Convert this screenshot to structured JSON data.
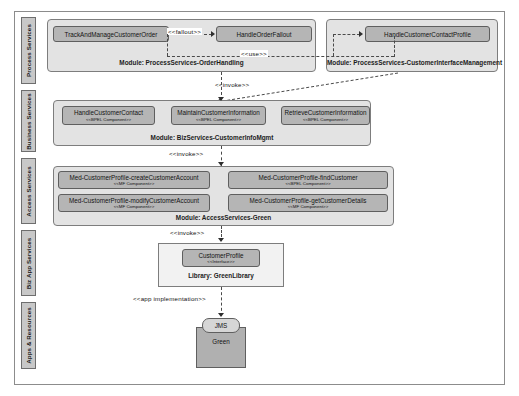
{
  "diagram": {
    "lanes": [
      {
        "id": "process",
        "label": "Process Services"
      },
      {
        "id": "business",
        "label": "Business Services"
      },
      {
        "id": "access",
        "label": "Access Services"
      },
      {
        "id": "bizapp",
        "label": "Biz App Services"
      },
      {
        "id": "apps",
        "label": "Apps & Resources"
      }
    ],
    "modules": [
      {
        "id": "mod-order-handling",
        "caption": "Module: ProcessServices-OrderHandling"
      },
      {
        "id": "mod-customer-interface",
        "caption": "Module: ProcessServices-CustomerInterfaceManagement"
      },
      {
        "id": "mod-biz-customer-info",
        "caption": "Module: BizServices-CustomerInfoMgmt"
      },
      {
        "id": "mod-access-green",
        "caption": "Module: AccessServices-Green"
      },
      {
        "id": "lib-green",
        "caption": "Library: GreenLibrary"
      }
    ],
    "components": {
      "track_order": {
        "name": "TrackAndManageCustomerOrder",
        "stereotype": ""
      },
      "handle_fallout": {
        "name": "HandleOrderFallout",
        "stereotype": ""
      },
      "handle_contact_profile": {
        "name": "HandleCustomerContactProfile",
        "stereotype": ""
      },
      "handle_customer_contact": {
        "name": "HandleCustomerContact",
        "stereotype": "<<BPEL Component>>"
      },
      "maintain_customer_info": {
        "name": "MaintainCustomerInformation",
        "stereotype": "<<BPEL Component>>"
      },
      "retrieve_customer_info": {
        "name": "RetrieveCustomerInformation",
        "stereotype": "<<BPEL Component>>"
      },
      "med_create_account": {
        "name": "Med-CustomerProfile-createCustomerAccount",
        "stereotype": "<<MF Component>>"
      },
      "med_modify_account": {
        "name": "Med-CustomerProfile-modifyCustomerAccount",
        "stereotype": "<<MF Component>>"
      },
      "med_find_customer": {
        "name": "Med-CustomerProfile-findCustomer",
        "stereotype": "<<BPEL Component>>"
      },
      "med_get_details": {
        "name": "Med-CustomerProfile-getCustomerDetails",
        "stereotype": "<<MF Component>>"
      },
      "customer_profile": {
        "name": "CustomerProfile",
        "stereotype": "<<Interface>>"
      },
      "jms": {
        "name": "JMS"
      },
      "green": {
        "name": "Green"
      }
    },
    "edges": [
      {
        "id": "fallout",
        "label": "<<fallout>>"
      },
      {
        "id": "use",
        "label": "<<use>>"
      },
      {
        "id": "invoke-business",
        "label": "<<invoke>>"
      },
      {
        "id": "invoke-access",
        "label": "<<invoke>>"
      },
      {
        "id": "invoke-bizapp",
        "label": "<<invoke>>"
      },
      {
        "id": "app-implementation",
        "label": "<<app implementation>>"
      }
    ],
    "colors": {
      "lane_label_bg": "#c8c8c8",
      "module_bg": "#e3e3e3",
      "component_bg": "#b5b5b5",
      "library_bg": "#f2f2f2",
      "resource_bg": "#b0b0b0",
      "frame_border": "#8c8c8c"
    }
  }
}
